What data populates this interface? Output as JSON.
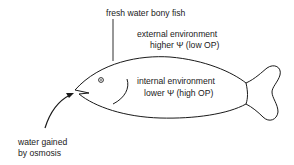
{
  "diagram": {
    "title_label": "fresh water bony fish",
    "external": {
      "line1": "external environment",
      "line2": "higher Ψ (low OP)"
    },
    "internal": {
      "line1": "internal environment",
      "line2": "lower Ψ (high OP)"
    },
    "arrow_label": {
      "line1": "water gained",
      "line2": "by osmosis"
    },
    "colors": {
      "stroke": "#1a1a1a",
      "background": "#ffffff"
    }
  }
}
